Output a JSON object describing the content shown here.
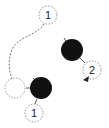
{
  "diagram": {
    "type": "touch-gesture-diagram",
    "colors": {
      "finger": "#111111",
      "dashed": "#888888",
      "label": "#222222"
    },
    "touch_points": [
      {
        "id": "finger-left",
        "filled": true
      },
      {
        "id": "finger-right",
        "filled": true
      }
    ],
    "labels": {
      "top_step": "1",
      "bottom_step": "1",
      "right_step": "2"
    }
  }
}
